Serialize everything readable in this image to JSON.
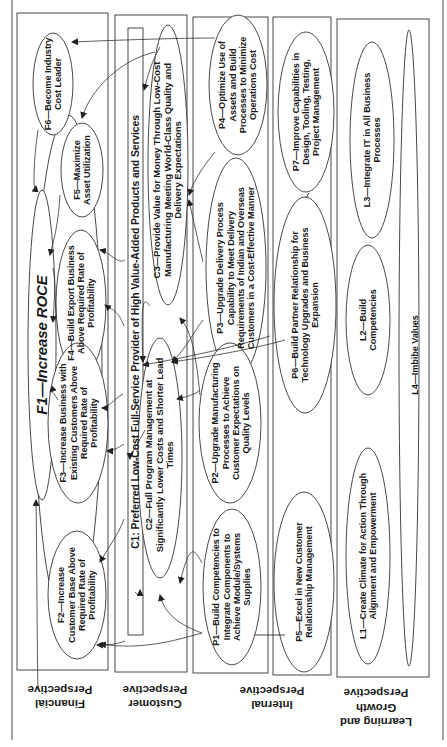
{
  "diagram": {
    "type": "balanced-scorecard-strategy-map",
    "orientation": "rotated-90-ccw",
    "line_color": "#333333",
    "perspectives": [
      {
        "id": "financial",
        "label": "Financial\nPerspective",
        "line1": "Financial",
        "line2": "Perspective"
      },
      {
        "id": "customer",
        "label": "Customer\nPerspective",
        "line1": "Customer",
        "line2": "Perspective"
      },
      {
        "id": "internal",
        "label": "Internal\nPerspective",
        "line1": "Internal",
        "line2": "Perspective"
      },
      {
        "id": "learning",
        "label": "Learning and\nGrowth\nPerspective",
        "line1": "Learning and",
        "line2": "Growth",
        "line3": "Perspective"
      }
    ],
    "objectives": {
      "F1": "F1—Increase ROCE",
      "F2": "F2—Increase Customer Base Above Required Rate of Profitability",
      "F3": "F3—Increase Business with Existing Customers Above Required Rate of Profitability",
      "F4": "F4—Build Export Business Above Required Rate of Profitability",
      "F5": "F5—Maximize Asset Utilization",
      "F6": "F6—Become Industry Cost Leader",
      "C1": "C1: Preferred Low-Cost Full-Service Provider of High Value-Added Products and Services",
      "C2": "C2—Full Program Management at Significantly Lower Costs and Shorter Lead Times",
      "C3": "C3—Provide Value for Money Through Low-Cost Manufacturing Meeting World-Class Quality and Delivery Expectations",
      "P1": "P1—Build Competencies to Integrate Components to Achieve Module/Systems Supplies",
      "P2": "P2—Upgrade Manufacturing Processes to Achieve Customer Expectations on Quality Levels",
      "P3": "P3—Upgrade Delivery Process Capability to Meet Delivery Requirements of Indian and Overseas Customers in a Cost-Effective Manner",
      "P4": "P4—Optimize Use of Assets and Build Processes to Minimize Operations Cost",
      "P5": "P5—Excel in New Customer Relationship Management",
      "P6": "P6—Build Partner Relationship for Technology Upgrades and Business Expansion",
      "P7": "P7—Improve Capabilities in Design, Tooling, Testing, Project Management",
      "L1": "L1—Create Climate for Action Through Alignment and Empowerment",
      "L2": "L2—Build Competencies",
      "L3": "L3—Integrate IT in All Business Processes",
      "L4": "L4—Imbibe Values"
    }
  }
}
